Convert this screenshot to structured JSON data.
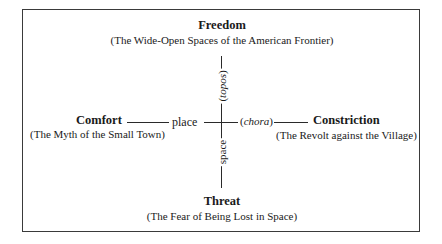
{
  "diagram": {
    "top": {
      "title": "Freedom",
      "subtitle": "(The Wide-Open Spaces of the American Frontier)"
    },
    "bottom": {
      "title": "Threat",
      "subtitle": "(The Fear of Being Lost in Space)"
    },
    "left": {
      "title": "Comfort",
      "subtitle": "(The Myth of the Small Town)"
    },
    "right": {
      "title": "Constriction",
      "subtitle": "(The Revolt against the Village)"
    },
    "axis_labels": {
      "left": "place",
      "right": "(chora)",
      "right_open": "(",
      "right_word": "chora",
      "right_close": ")",
      "top": "(topos)",
      "top_open": "(",
      "top_word": "topos",
      "top_close": ")",
      "bottom": "space"
    }
  }
}
